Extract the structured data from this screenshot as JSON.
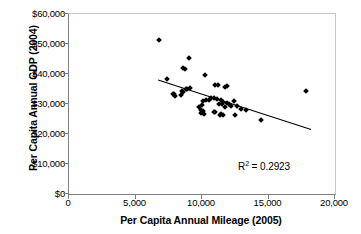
{
  "chart_data": {
    "type": "scatter",
    "title": "",
    "xlabel": "Per Capita Annual Mileage (2005)",
    "ylabel": "Per Capita Annual GDP (2004)",
    "xlim": [
      0,
      20000
    ],
    "ylim": [
      0,
      60000
    ],
    "xticks": [
      "0",
      "5,000",
      "10,000",
      "15,000",
      "20,000"
    ],
    "xtick_values": [
      0,
      5000,
      10000,
      15000,
      20000
    ],
    "yticks": [
      "$0",
      "$10,000",
      "$20,000",
      "$30,000",
      "$40,000",
      "$50,000",
      "$60,000"
    ],
    "ytick_values": [
      0,
      10000,
      20000,
      30000,
      40000,
      50000,
      60000
    ],
    "grid": false,
    "legend": null,
    "annotations": [
      {
        "name": "r-squared",
        "text": "R2 = 0.2923",
        "value": 0.2923,
        "x": 16200,
        "y": 8500
      }
    ],
    "trendline": {
      "type": "linear",
      "x_start": 6700,
      "y_start": 38000,
      "x_end": 18200,
      "y_end": 21500
    },
    "points": [
      {
        "x": 6800,
        "y": 51200
      },
      {
        "x": 9000,
        "y": 45400
      },
      {
        "x": 8600,
        "y": 42000
      },
      {
        "x": 8750,
        "y": 41700
      },
      {
        "x": 10200,
        "y": 39700
      },
      {
        "x": 7400,
        "y": 38200
      },
      {
        "x": 11000,
        "y": 36300
      },
      {
        "x": 11200,
        "y": 36300
      },
      {
        "x": 11900,
        "y": 35900
      },
      {
        "x": 11700,
        "y": 35800
      },
      {
        "x": 9100,
        "y": 35200
      },
      {
        "x": 8900,
        "y": 35000
      },
      {
        "x": 8800,
        "y": 34900
      },
      {
        "x": 8500,
        "y": 34300
      },
      {
        "x": 8600,
        "y": 34100
      },
      {
        "x": 7900,
        "y": 33500
      },
      {
        "x": 7800,
        "y": 33400
      },
      {
        "x": 17800,
        "y": 34200
      },
      {
        "x": 8450,
        "y": 33000
      },
      {
        "x": 7950,
        "y": 32600
      },
      {
        "x": 10700,
        "y": 32000
      },
      {
        "x": 10900,
        "y": 31900
      },
      {
        "x": 11100,
        "y": 31700
      },
      {
        "x": 10500,
        "y": 31500
      },
      {
        "x": 11400,
        "y": 31300
      },
      {
        "x": 10300,
        "y": 31200
      },
      {
        "x": 10100,
        "y": 30900
      },
      {
        "x": 11600,
        "y": 30800
      },
      {
        "x": 12400,
        "y": 30900
      },
      {
        "x": 11850,
        "y": 30200
      },
      {
        "x": 12000,
        "y": 30100
      },
      {
        "x": 11500,
        "y": 30000
      },
      {
        "x": 11300,
        "y": 29900
      },
      {
        "x": 10000,
        "y": 29600
      },
      {
        "x": 12200,
        "y": 29500
      },
      {
        "x": 12600,
        "y": 29400
      },
      {
        "x": 9800,
        "y": 29000
      },
      {
        "x": 11750,
        "y": 28900
      },
      {
        "x": 12900,
        "y": 28200
      },
      {
        "x": 13300,
        "y": 28000
      },
      {
        "x": 9900,
        "y": 28100
      },
      {
        "x": 10050,
        "y": 27600
      },
      {
        "x": 11000,
        "y": 27400
      },
      {
        "x": 10900,
        "y": 27200
      },
      {
        "x": 9950,
        "y": 26900
      },
      {
        "x": 10150,
        "y": 26800
      },
      {
        "x": 11450,
        "y": 26600
      },
      {
        "x": 11600,
        "y": 26500
      },
      {
        "x": 11350,
        "y": 26400
      },
      {
        "x": 12500,
        "y": 26200
      },
      {
        "x": 14400,
        "y": 24600
      }
    ]
  }
}
